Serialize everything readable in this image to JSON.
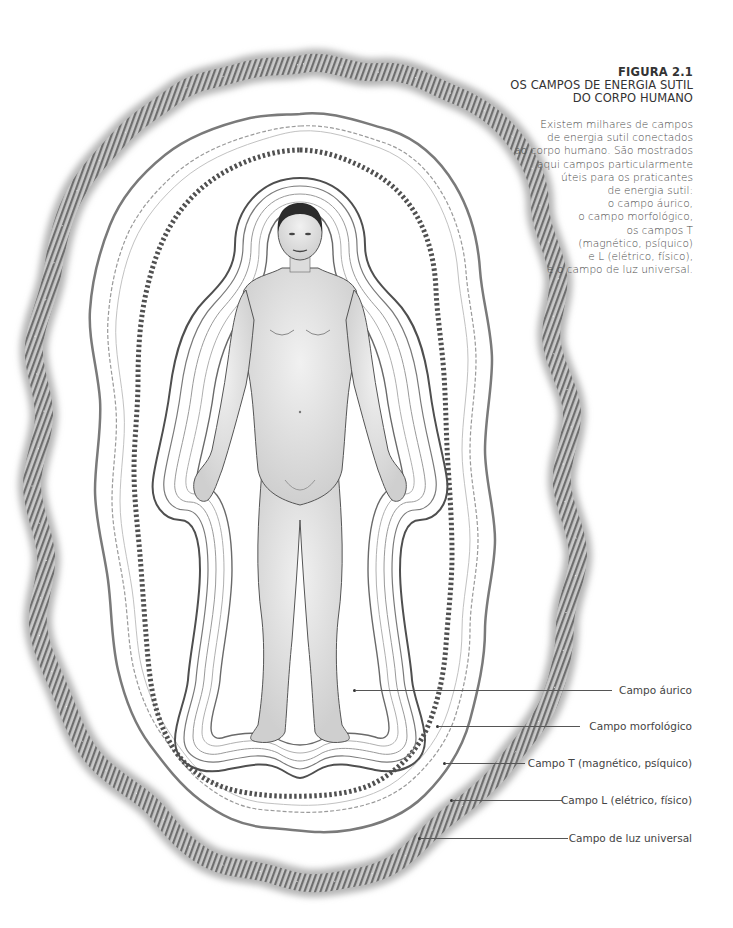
{
  "caption": {
    "figure_number": "FIGURA 2.1",
    "title_lines": [
      "OS CAMPOS DE ENERGIA SUTIL",
      "DO CORPO HUMANO"
    ],
    "description_lines": [
      "Existem milhares de campos",
      "de energia sutil conectados",
      "ao corpo humano. São mostrados",
      "aqui campos particularmente",
      "úteis para os praticantes",
      "de energia sutil:",
      "o campo áurico,",
      "o campo morfológico,",
      "os campos T",
      "(magnético, psíquico)",
      "e L (elétrico, físico),",
      "e o campo de luz universal."
    ]
  },
  "labels": [
    {
      "text": "Campo áurico",
      "y": 690,
      "x_start": 355
    },
    {
      "text": "Campo morfológico",
      "y": 726,
      "x_start": 438
    },
    {
      "text": "Campo T (magnético, psíquico)",
      "y": 763,
      "x_start": 445
    },
    {
      "text": "Campo L (elétrico, físico)",
      "y": 800,
      "x_start": 452
    },
    {
      "text": "Campo de luz universal",
      "y": 838,
      "x_start": 420
    }
  ],
  "colors": {
    "text": "#3a3a3a",
    "outer_band": "#8a8a8a",
    "rings": "#5a5a5a",
    "dotted_band": "#4a4a4a"
  }
}
